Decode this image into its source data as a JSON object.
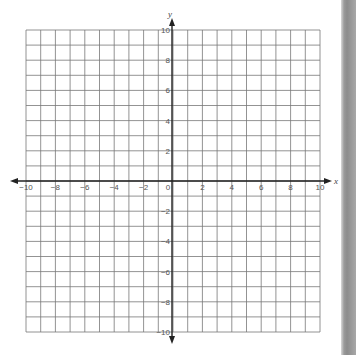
{
  "chart_data": {
    "type": "coordinate-grid",
    "title": "",
    "xlabel": "x",
    "ylabel": "y",
    "xlim": [
      -10,
      10
    ],
    "ylim": [
      -10,
      10
    ],
    "grid": true,
    "grid_step": 1,
    "x_tick_labels": [
      "-10",
      "-8",
      "-6",
      "-4",
      "-2",
      "0",
      "2",
      "4",
      "6",
      "8",
      "10"
    ],
    "y_tick_labels": [
      "10",
      "8",
      "6",
      "4",
      "2",
      "-2",
      "-4",
      "-6",
      "-8",
      "-10"
    ],
    "series": []
  },
  "axes": {
    "x_label": "x",
    "y_label": "y"
  },
  "colors": {
    "grid_line": "#777777",
    "axis_line": "#222222",
    "page_border": "#8c8c8c"
  }
}
